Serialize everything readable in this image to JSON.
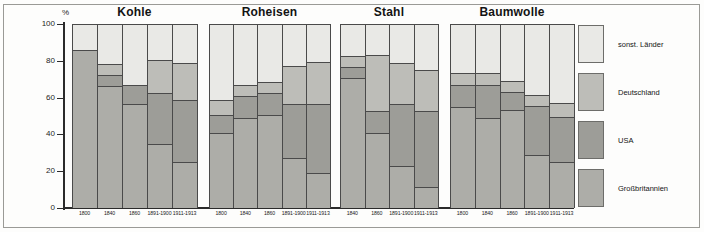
{
  "figure": {
    "axis_unit": "%",
    "y_ticks": [
      0,
      20,
      40,
      60,
      80,
      100
    ],
    "y_tick_labels": [
      "0",
      "20",
      "40",
      "60",
      "80",
      "100"
    ]
  },
  "legend": {
    "items": [
      {
        "label": "sonst. Länder",
        "key": "other",
        "color": "#e9e9e6"
      },
      {
        "label": "Deutschland",
        "key": "de",
        "color": "#bdbdb8"
      },
      {
        "label": "USA",
        "key": "usa",
        "color": "#9d9d98"
      },
      {
        "label": "Großbritannien",
        "key": "gb",
        "color": "#adada8"
      }
    ]
  },
  "chart_data": {
    "type": "bar",
    "title": "",
    "subtitle": "",
    "xlabel": "",
    "ylabel": "%",
    "ylim": [
      0,
      100
    ],
    "grid": false,
    "stacked": true,
    "legend_position": "right",
    "series_order": [
      "Großbritannien",
      "USA",
      "Deutschland",
      "sonst. Länder"
    ],
    "panels": [
      {
        "title": "Kohle",
        "categories": [
          "1800",
          "1840",
          "1860",
          "1891-1900",
          "1911-1913"
        ],
        "series": [
          {
            "name": "Großbritannien",
            "values": [
              86.0,
              66.0,
              56.5,
              34.5,
              24.5
            ]
          },
          {
            "name": "USA",
            "values": [
              0.0,
              6.0,
              10.0,
              28.0,
              34.0
            ]
          },
          {
            "name": "Deutschland",
            "values": [
              0.0,
              6.0,
              0.0,
              18.0,
              20.0
            ]
          },
          {
            "name": "sonst. Länder",
            "values": [
              14.0,
              22.0,
              33.5,
              19.5,
              21.5
            ]
          }
        ]
      },
      {
        "title": "Roheisen",
        "categories": [
          "1800",
          "1840",
          "1860",
          "1891-1900",
          "1911-1913"
        ],
        "series": [
          {
            "name": "Großbritannien",
            "values": [
              40.5,
              48.5,
              50.5,
              26.5,
              18.5
            ]
          },
          {
            "name": "USA",
            "values": [
              10.0,
              12.0,
              12.0,
              30.0,
              38.0
            ]
          },
          {
            "name": "Deutschland",
            "values": [
              8.0,
              6.0,
              6.0,
              20.5,
              22.5
            ]
          },
          {
            "name": "sonst. Länder",
            "values": [
              41.5,
              33.5,
              31.5,
              23.0,
              21.0
            ]
          }
        ]
      },
      {
        "title": "Stahl",
        "categories": [
          "1840",
          "1860",
          "1891-1900",
          "1911-1913"
        ],
        "series": [
          {
            "name": "Großbritannien",
            "values": [
              70.5,
              40.5,
              22.5,
              11.0
            ]
          },
          {
            "name": "USA",
            "values": [
              6.0,
              12.0,
              34.0,
              41.5
            ]
          },
          {
            "name": "Deutschland",
            "values": [
              6.0,
              30.5,
              22.0,
              22.5
            ]
          },
          {
            "name": "sonst. Länder",
            "values": [
              17.5,
              17.0,
              21.5,
              25.0
            ]
          }
        ]
      },
      {
        "title": "Baumwolle",
        "categories": [
          "1800",
          "1840",
          "1860",
          "1891-1900",
          "1911-1913"
        ],
        "series": [
          {
            "name": "Großbritannien",
            "values": [
              54.5,
              48.5,
              53.0,
              28.5,
              24.5
            ]
          },
          {
            "name": "USA",
            "values": [
              12.0,
              18.0,
              10.0,
              26.5,
              24.5
            ]
          },
          {
            "name": "Deutschland",
            "values": [
              6.5,
              6.5,
              6.0,
              6.0,
              8.0
            ]
          },
          {
            "name": "sonst. Länder",
            "values": [
              27.0,
              27.0,
              31.0,
              39.0,
              43.0
            ]
          }
        ]
      }
    ]
  }
}
